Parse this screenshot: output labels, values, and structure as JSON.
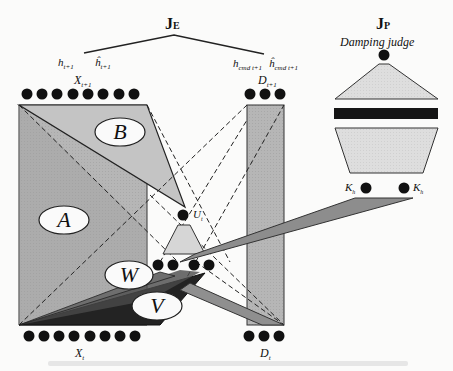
{
  "figure": {
    "je_label": "J_E",
    "je_main": "J",
    "je_sub": "E",
    "jp_label": "J_P",
    "jp_main": "J",
    "jp_sub": "P",
    "damping_judge": "Damping judge",
    "h_labels": [
      {
        "main": "h",
        "sub": "t+1"
      },
      {
        "main": "ĥ",
        "sub": "t+1"
      },
      {
        "main": "h",
        "sub": "cmd t+1"
      },
      {
        "main": "ĥ",
        "sub": "cmd t+1"
      }
    ],
    "node_groups": {
      "x_next": {
        "label_main": "X",
        "label_sub": "t+1",
        "count": 8
      },
      "d_next": {
        "label_main": "D",
        "label_sub": "t+1",
        "count": 3
      },
      "x_t": {
        "label_main": "X",
        "label_sub": "t",
        "count": 8
      },
      "d_t": {
        "label_main": "D",
        "label_sub": "t",
        "count": 3
      },
      "u_layer": {
        "count": 4
      },
      "u_t": {
        "label_main": "U",
        "label_sub": "t"
      },
      "k": [
        {
          "label_main": "K",
          "label_sub": "h"
        },
        {
          "label_main": "K",
          "label_sub": "h"
        }
      ]
    },
    "weight_regions": [
      "A",
      "B",
      "W",
      "V"
    ],
    "colors": {
      "region_gray": "#b4b4b4",
      "region_dark": "#8a8a8a",
      "light_fill": "#dcdcdc",
      "node": "#111111",
      "bar": "#151515"
    }
  }
}
